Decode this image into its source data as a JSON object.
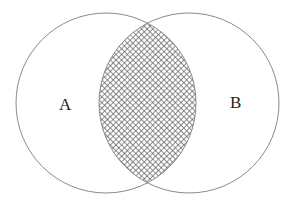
{
  "diagram": {
    "type": "venn",
    "sets": [
      {
        "id": "A",
        "label": "A",
        "cx": 106,
        "cy": 103,
        "r": 90
      },
      {
        "id": "B",
        "label": "B",
        "cx": 189,
        "cy": 103,
        "r": 90
      }
    ],
    "intersection": {
      "sets": [
        "A",
        "B"
      ],
      "shaded": true,
      "pattern": "crosshatch"
    },
    "colors": {
      "outline": "#8a8a8a",
      "hatch": "#555555",
      "background": "#ffffff",
      "label": "#222222"
    }
  }
}
